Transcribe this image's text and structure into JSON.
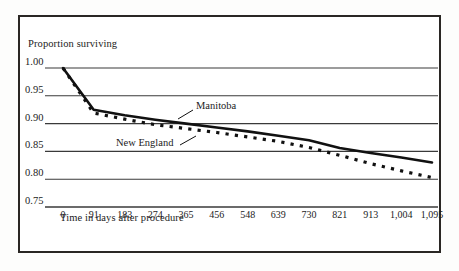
{
  "chart_data": {
    "type": "line",
    "title": "",
    "ylabel": "Proportion surviving",
    "xlabel": "Time in days after procedure",
    "xlim": [
      0,
      1095
    ],
    "ylim": [
      0.75,
      1.0
    ],
    "grid": "horizontal",
    "legend_position": "inline-annotations",
    "y_ticks": [
      "1.00",
      "0.95",
      "0.90",
      "0.85",
      "0.80",
      "0.75"
    ],
    "y_tick_values": [
      1.0,
      0.95,
      0.9,
      0.85,
      0.8,
      0.75
    ],
    "x_ticks": [
      "0",
      "91",
      "183",
      "274",
      "365",
      "456",
      "548",
      "639",
      "730",
      "821",
      "913",
      "1,004",
      "1,095"
    ],
    "x_tick_values": [
      0,
      91,
      183,
      274,
      365,
      456,
      548,
      639,
      730,
      821,
      913,
      1004,
      1095
    ],
    "x": [
      0,
      91,
      183,
      274,
      365,
      456,
      548,
      639,
      730,
      821,
      913,
      1004,
      1095
    ],
    "series": [
      {
        "name": "Manitoba",
        "style": "solid",
        "color": "#111111",
        "values": [
          1.0,
          0.925,
          0.915,
          0.907,
          0.9,
          0.893,
          0.886,
          0.878,
          0.87,
          0.856,
          0.847,
          0.839,
          0.83
        ]
      },
      {
        "name": "New England",
        "style": "dotted",
        "color": "#111111",
        "values": [
          1.0,
          0.919,
          0.908,
          0.898,
          0.891,
          0.884,
          0.876,
          0.868,
          0.857,
          0.843,
          0.828,
          0.815,
          0.803
        ]
      }
    ],
    "annotations": [
      {
        "text": "Manitoba",
        "target_series": "Manitoba"
      },
      {
        "text": "New England",
        "target_series": "New England"
      }
    ]
  }
}
